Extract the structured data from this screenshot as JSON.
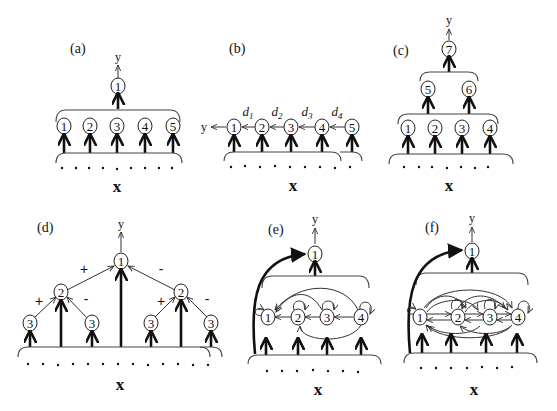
{
  "figure": {
    "panels": [
      {
        "id": "a",
        "label": "(a)",
        "output_label": "y",
        "input_label": "x",
        "output_node": "1",
        "hidden_nodes": [
          "1",
          "2",
          "3",
          "4",
          "5"
        ]
      },
      {
        "id": "b",
        "label": "(b)",
        "output_label": "y",
        "input_label": "x",
        "chain_nodes": [
          "1",
          "2",
          "3",
          "4",
          "5"
        ],
        "edge_labels": [
          "d",
          "d",
          "d",
          "d"
        ],
        "edge_subscripts": [
          "1",
          "2",
          "3",
          "4"
        ]
      },
      {
        "id": "c",
        "label": "(c)",
        "output_label": "y",
        "input_label": "x",
        "output_node": "7",
        "middle_nodes": [
          "5",
          "6"
        ],
        "bottom_nodes": [
          "1",
          "2",
          "3",
          "4"
        ]
      },
      {
        "id": "d",
        "label": "(d)",
        "output_label": "y",
        "input_label": "x",
        "root_node": "1",
        "level2_nodes": [
          "2",
          "2"
        ],
        "leaf_nodes": [
          "3",
          "3",
          "3",
          "3"
        ],
        "edge_signs": {
          "root_left": "+",
          "root_right": "-",
          "left_left": "+",
          "left_right": "-",
          "right_left": "+",
          "right_right": "-"
        }
      },
      {
        "id": "e",
        "label": "(e)",
        "output_label": "y",
        "input_label": "x",
        "output_node": "1",
        "recurrent_nodes": [
          "1",
          "2",
          "3",
          "4"
        ]
      },
      {
        "id": "f",
        "label": "(f)",
        "output_label": "y",
        "input_label": "x",
        "output_node": "1",
        "recurrent_nodes": [
          "1",
          "2",
          "3",
          "4"
        ]
      }
    ]
  }
}
